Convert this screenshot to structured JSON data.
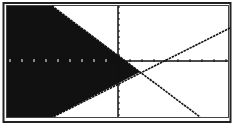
{
  "screen": {
    "description": "Graphing calculator display of a system of linear inequalities",
    "background": "#ffffff",
    "ink": "#111111"
  },
  "chart_data": {
    "type": "line",
    "title": "",
    "xlabel": "",
    "ylabel": "",
    "grid": false,
    "legend": null,
    "axes": {
      "x_axis_pixel_y": 61,
      "y_axis_pixel_x": 118,
      "x_tick_spacing_px": 12,
      "y_tick_spacing_px": 6
    },
    "series": [
      {
        "name": "line-1-decreasing",
        "points_px": [
          [
            52,
            6
          ],
          [
            200,
            117
          ]
        ],
        "style": "solid"
      },
      {
        "name": "line-2-increasing",
        "points_px": [
          [
            230,
            28
          ],
          [
            53,
            117
          ]
        ],
        "style": "solid"
      }
    ],
    "intersection_px": [
      140,
      72
    ],
    "shaded_region": {
      "description": "Region to the left of both lines (solution set of system of inequalities)",
      "polygon_px": [
        [
          7,
          6
        ],
        [
          52,
          6
        ],
        [
          140,
          72
        ],
        [
          53,
          117
        ],
        [
          7,
          117
        ]
      ],
      "fill": "#111111"
    }
  }
}
